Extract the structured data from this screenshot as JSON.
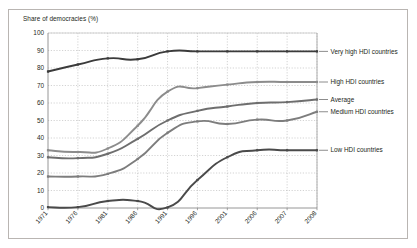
{
  "chart_data": {
    "type": "line",
    "title": "",
    "ylabel": "Share of democracies (%)",
    "xlabel": "",
    "ylim": [
      0,
      100
    ],
    "ytick_step": 10,
    "yticks": [
      0,
      10,
      20,
      30,
      40,
      50,
      60,
      70,
      80,
      90,
      100
    ],
    "grid": "dotted-both",
    "legend_position": "right-inline",
    "categories": [
      "1971",
      "1976",
      "1981",
      "1986",
      "1991",
      "1996",
      "2001",
      "2006",
      "2007",
      "2008"
    ],
    "series": [
      {
        "name": "Very high HDI countries",
        "color": "#3b3b3b",
        "values": [
          78,
          82,
          85.5,
          85,
          89.5,
          89.5,
          89.5,
          89.5,
          89.5,
          89.5
        ]
      },
      {
        "name": "High HDI countries",
        "color": "#8c8c8c",
        "values": [
          33,
          32,
          34,
          47,
          66.5,
          68.5,
          70.5,
          72,
          72,
          72
        ]
      },
      {
        "name": "Average",
        "color": "#6e6e6e",
        "values": [
          29,
          28.5,
          31,
          39.5,
          50,
          55.5,
          58,
          60,
          60.5,
          62
        ]
      },
      {
        "name": "Medium HDI countries",
        "color": "#7d7d7d",
        "values": [
          18,
          18,
          19.5,
          28,
          43,
          49.5,
          48,
          50.5,
          50,
          55
        ]
      },
      {
        "name": "Low HDI countries",
        "color": "#4a4a4a",
        "values": [
          0.5,
          0.5,
          4,
          4,
          0.3,
          16,
          29,
          33,
          33,
          33
        ]
      }
    ],
    "legend_labels": [
      {
        "label": "Very high HDI countries",
        "at_y": 89.5
      },
      {
        "label": "High HDI countries",
        "at_y": 72
      },
      {
        "label": "Average",
        "at_y": 62
      },
      {
        "label": "Medium HDI countries",
        "at_y": 55
      },
      {
        "label": "Low HDI countries",
        "at_y": 33
      }
    ]
  },
  "colors": {
    "frame": "#b9b5b2",
    "axis": "#8a8a8a",
    "grid": "#b5b5b5",
    "text": "#231f20"
  }
}
